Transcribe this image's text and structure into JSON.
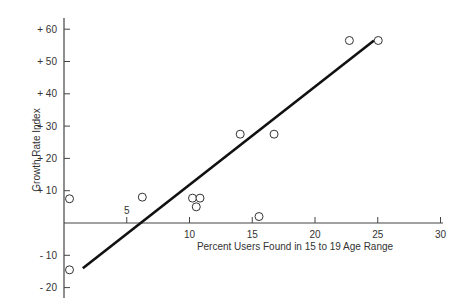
{
  "chart_data": {
    "type": "scatter",
    "title": "",
    "xlabel": "Percent Users Found in 15 to 19 Age Range",
    "ylabel": "Growth Rate Index",
    "xlim": [
      0,
      30
    ],
    "ylim": [
      -20,
      65
    ],
    "grid": false,
    "legend": null,
    "x_ticks": [
      5,
      10,
      15,
      20,
      25,
      30
    ],
    "x_tick_labels": [
      "5",
      "10",
      "15",
      "20",
      "25",
      "30"
    ],
    "y_ticks": [
      60,
      50,
      40,
      30,
      20,
      10,
      -10,
      -20
    ],
    "y_tick_labels": [
      "+ 60",
      "+ 50",
      "+ 40",
      "+ 30",
      "+ 20",
      "+ 10",
      "- 10",
      "- 20"
    ],
    "series": [
      {
        "name": "observations",
        "marker": "open-circle",
        "points": [
          {
            "x": 0.2,
            "y": 7.5
          },
          {
            "x": 0.2,
            "y": -14.5
          },
          {
            "x": 6.0,
            "y": 8.0
          },
          {
            "x": 10.0,
            "y": 7.7
          },
          {
            "x": 10.6,
            "y": 7.7
          },
          {
            "x": 10.3,
            "y": 5.0
          },
          {
            "x": 15.3,
            "y": 2.0
          },
          {
            "x": 13.8,
            "y": 27.5
          },
          {
            "x": 16.5,
            "y": 27.5
          },
          {
            "x": 22.5,
            "y": 56.5
          },
          {
            "x": 24.8,
            "y": 56.5
          }
        ]
      }
    ],
    "trend_line": {
      "name": "regression-line",
      "start": {
        "x": 1.5,
        "y": -14.0
      },
      "end": {
        "x": 24.7,
        "y": 56.5
      }
    },
    "colors": {
      "axis": "#444444",
      "marker": "#333333",
      "trend": "#111111",
      "text": "#333333"
    }
  }
}
